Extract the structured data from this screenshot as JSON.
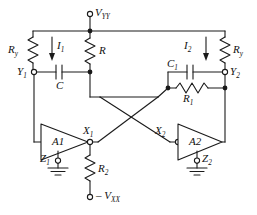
{
  "diagram": {
    "type": "schematic",
    "stroke_color": "#1a1a1a",
    "background_color": "#ffffff"
  },
  "supplies": {
    "positive": "V",
    "positive_sub": "YY",
    "negative_prefix": "– V",
    "negative_sub": "XX"
  },
  "components": {
    "r_y_left": {
      "label": "R",
      "sub": "y"
    },
    "r_y_right": {
      "label": "R",
      "sub": "y"
    },
    "r_top": {
      "label": "R",
      "sub": ""
    },
    "r_1": {
      "label": "R",
      "sub": "1"
    },
    "r_2": {
      "label": "R",
      "sub": "2"
    },
    "c_left": {
      "label": "C",
      "sub": ""
    },
    "c_1": {
      "label": "C",
      "sub": "1"
    },
    "amp_1": {
      "label": "A1"
    },
    "amp_2": {
      "label": "A2"
    }
  },
  "currents": {
    "i_1": {
      "label": "I",
      "sub": "1"
    },
    "i_2": {
      "label": "I",
      "sub": "2"
    }
  },
  "terminals": {
    "y_1": {
      "label": "Y",
      "sub": "1"
    },
    "y_2": {
      "label": "Y",
      "sub": "2"
    },
    "x_1": {
      "label": "X",
      "sub": "1"
    },
    "x_2": {
      "label": "X",
      "sub": "2"
    },
    "z_1": {
      "label": "Z",
      "sub": "1"
    },
    "z_2": {
      "label": "Z",
      "sub": "2"
    }
  },
  "ground": {
    "left_name": "ground-symbol-left",
    "right_name": "ground-symbol-right"
  }
}
